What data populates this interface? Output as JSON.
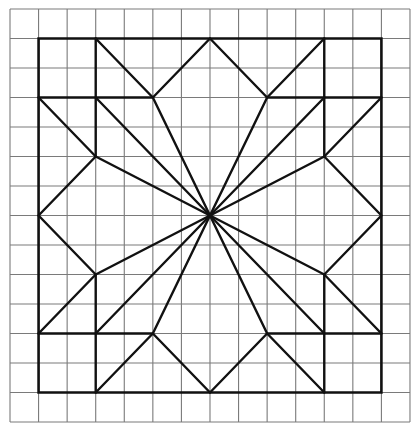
{
  "diagram": {
    "type": "quilt-block-on-grid",
    "grid": {
      "columns": 14,
      "rows": 14,
      "origin_px": [
        10,
        9
      ],
      "cell_w_px": 28.57,
      "cell_h_px": 29.5,
      "line_color": "#7a7a7a"
    },
    "figure": {
      "line_color": "#111111",
      "center": [
        7,
        7
      ],
      "border": [
        [
          1,
          1
        ],
        [
          13,
          1
        ],
        [
          13,
          13
        ],
        [
          1,
          13
        ]
      ],
      "segments": [
        [
          [
            3,
            1
          ],
          [
            3,
            5
          ]
        ],
        [
          [
            1,
            3
          ],
          [
            5,
            3
          ]
        ],
        [
          [
            3,
            1
          ],
          [
            5,
            3
          ]
        ],
        [
          [
            5,
            3
          ],
          [
            7,
            1
          ]
        ],
        [
          [
            1,
            3
          ],
          [
            3,
            5
          ]
        ],
        [
          [
            3,
            5
          ],
          [
            1,
            7
          ]
        ],
        [
          [
            11,
            1
          ],
          [
            11,
            5
          ]
        ],
        [
          [
            9,
            3
          ],
          [
            13,
            3
          ]
        ],
        [
          [
            11,
            1
          ],
          [
            9,
            3
          ]
        ],
        [
          [
            9,
            3
          ],
          [
            7,
            1
          ]
        ],
        [
          [
            13,
            3
          ],
          [
            11,
            5
          ]
        ],
        [
          [
            11,
            5
          ],
          [
            13,
            7
          ]
        ],
        [
          [
            3,
            13
          ],
          [
            3,
            9
          ]
        ],
        [
          [
            1,
            11
          ],
          [
            5,
            11
          ]
        ],
        [
          [
            3,
            13
          ],
          [
            5,
            11
          ]
        ],
        [
          [
            5,
            11
          ],
          [
            7,
            13
          ]
        ],
        [
          [
            1,
            11
          ],
          [
            3,
            9
          ]
        ],
        [
          [
            3,
            9
          ],
          [
            1,
            7
          ]
        ],
        [
          [
            11,
            13
          ],
          [
            11,
            9
          ]
        ],
        [
          [
            9,
            11
          ],
          [
            13,
            11
          ]
        ],
        [
          [
            11,
            13
          ],
          [
            9,
            11
          ]
        ],
        [
          [
            9,
            11
          ],
          [
            7,
            13
          ]
        ],
        [
          [
            13,
            11
          ],
          [
            11,
            9
          ]
        ],
        [
          [
            11,
            9
          ],
          [
            13,
            7
          ]
        ]
      ],
      "rays_to": [
        [
          5,
          3
        ],
        [
          3,
          3
        ],
        [
          3,
          5
        ],
        [
          9,
          3
        ],
        [
          11,
          3
        ],
        [
          11,
          5
        ],
        [
          3,
          9
        ],
        [
          3,
          11
        ],
        [
          5,
          11
        ],
        [
          11,
          9
        ],
        [
          11,
          11
        ],
        [
          9,
          11
        ]
      ]
    }
  }
}
